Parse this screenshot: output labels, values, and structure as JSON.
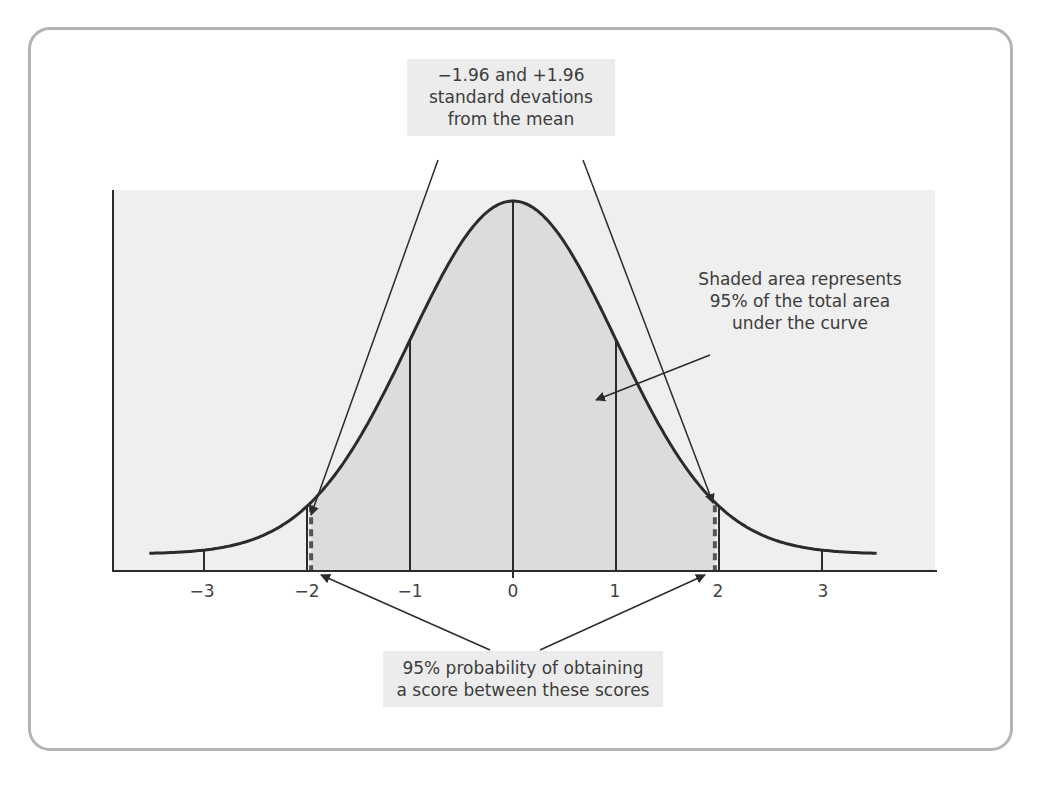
{
  "figure": {
    "type": "normal-distribution-diagram",
    "annotations": {
      "top": [
        "−1.96 and +1.96",
        "standard devations",
        "from the mean"
      ],
      "right": [
        "Shaded area represents",
        "95% of the total area",
        "under the curve"
      ],
      "bottom": [
        "95% probability of obtaining",
        "a score between these scores"
      ]
    },
    "x_ticks": [
      {
        "value": -3,
        "label": "−3"
      },
      {
        "value": -2,
        "label": "−2"
      },
      {
        "value": -1,
        "label": "−1"
      },
      {
        "value": 0,
        "label": "0"
      },
      {
        "value": 1,
        "label": "1"
      },
      {
        "value": 2,
        "label": "2"
      },
      {
        "value": 3,
        "label": "3"
      }
    ],
    "colors": {
      "panel_bg": "#efefef",
      "shaded_area": "#dcdcdc",
      "curve": "#2b2b2b",
      "frame_border": "#b3b3b3",
      "label_bg": "#ececec",
      "dashed_line": "#555555"
    }
  },
  "chart_data": {
    "type": "area",
    "title": "",
    "xlabel": "Standard deviations from the mean (z)",
    "ylabel": "",
    "distribution": "standard normal",
    "mean": 0,
    "sd": 1,
    "xlim": [
      -3.5,
      3.5
    ],
    "x_ticks": [
      -3,
      -2,
      -1,
      0,
      1,
      2,
      3
    ],
    "vertical_lines_at": [
      -3,
      -2,
      -1,
      0,
      1,
      2,
      3
    ],
    "shaded_region": {
      "from": -1.96,
      "to": 1.96,
      "area_percent": 95
    },
    "dashed_lines_at": [
      -1.96,
      1.96
    ],
    "x": [
      -3.5,
      -3,
      -2.5,
      -2,
      -1.96,
      -1.5,
      -1,
      -0.5,
      0,
      0.5,
      1,
      1.5,
      1.96,
      2,
      2.5,
      3,
      3.5
    ],
    "y": [
      0.0009,
      0.0044,
      0.0175,
      0.054,
      0.0584,
      0.1295,
      0.242,
      0.3521,
      0.3989,
      0.3521,
      0.242,
      0.1295,
      0.0584,
      0.054,
      0.0175,
      0.0044,
      0.0009
    ],
    "annotations": [
      "−1.96 and +1.96 standard devations from the mean",
      "Shaded area represents 95% of the total area under the curve",
      "95% probability of obtaining a score between these scores"
    ],
    "grid": false,
    "legend": null
  }
}
